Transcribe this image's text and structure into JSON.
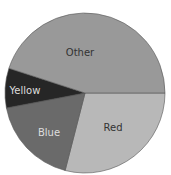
{
  "chart_data": {
    "type": "pie",
    "title": "",
    "categories": [
      "Red",
      "Blue",
      "Yellow",
      "Other"
    ],
    "values": [
      29,
      18,
      8,
      45
    ],
    "colors": [
      "#b8b8b8",
      "#6a6a6a",
      "#262626",
      "#999999"
    ],
    "start_angle": "3 o'clock, clockwise",
    "legend": "none (labels inside slices)"
  },
  "labels": {
    "red": "Red",
    "blue": "Blue",
    "yellow": "Yellow",
    "other": "Other"
  }
}
